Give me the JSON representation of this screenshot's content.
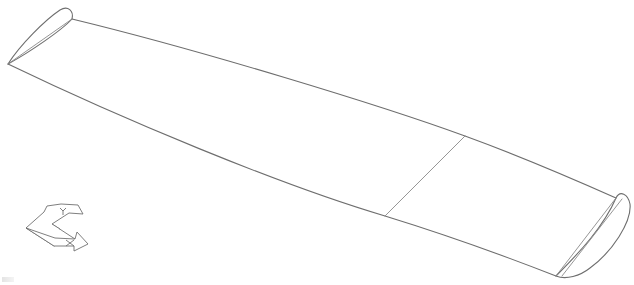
{
  "view": {
    "width": 634,
    "height": 285,
    "background": "#ffffff",
    "line_color": "#6e6e6e"
  },
  "model": {
    "name": "wing",
    "root_airfoil": {
      "outline": "M 8 64 C 20 45, 45 20, 60 10 C 68 5, 74 11, 72 19 C 62 30, 30 52, 8 64 Z",
      "chord": "M 8 64 L 72 19"
    },
    "tip_airfoil": {
      "outline": "M 556 276 C 580 252, 604 226, 616 198 C 620 190, 628 194, 630 204 C 632 222, 612 252, 590 268 C 580 276, 566 280, 556 276 Z",
      "chord": "M 556 276 L 616 198",
      "chord2": "M 562 276 L 622 199"
    },
    "leading_edge": "M 72 19 C 200 50, 380 105, 465 136 C 520 156, 580 182, 616 198",
    "trailing_edge": "M 8 64 C 120 118, 280 185, 385 216 C 450 236, 510 258, 556 276",
    "section_line": "M 385 216 L 465 136"
  },
  "triad": {
    "label": "coordinate-axes",
    "y_arrow": "M 26 228 L 44 212 L 47 206 L 61 204 L 78 205 L 83 214 L 69 213 L 52 224 L 60 229",
    "x_arrow": "M 26 228 L 55 238 L 75 239 L 77 232 L 88 244 L 74 251 L 74 246 L 54 246 L 26 228",
    "plane": "M 26 228 L 52 224 L 75 239 L 54 246 Z",
    "y_glyph": "M 60 208 L 63 211 L 66 208 M 63 211 L 63 215",
    "x_glyph": "M 66 240 L 74 246 M 74 240 L 66 246",
    "x_axis_letter": "X",
    "y_axis_letter": "Y"
  }
}
